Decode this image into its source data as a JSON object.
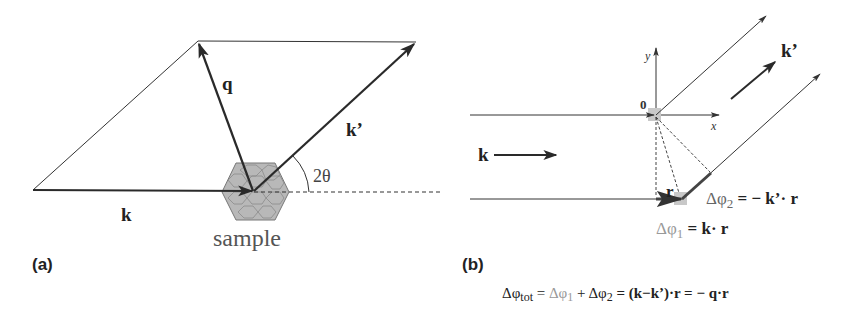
{
  "panel_a": {
    "label": "(a)",
    "vector_k": "k",
    "vector_k_prime": "k’",
    "vector_q": "q",
    "angle": "2θ",
    "sample_label": "sample"
  },
  "panel_b": {
    "label": "(b)",
    "axis_y": "y",
    "axis_x": "x",
    "origin": "0",
    "vector_k": "k",
    "vector_k_prime": "k’",
    "vector_r": "r",
    "eq_dphi2_lhs": "Δφ",
    "eq_dphi2_sub": "2",
    "eq_dphi2_rhs": " = − k’· r",
    "eq_dphi1_lhs": "Δφ",
    "eq_dphi1_sub": "1",
    "eq_dphi1_rhs": " = k· r",
    "eq_total": {
      "lhs": "Δφ",
      "lhs_sub": "tot",
      "eq1": " = ",
      "t1": "Δφ",
      "t1_sub": "1",
      "plus": " + Δφ",
      "t2_sub": "2",
      "rest": " = (k−k’)·r = − q·r"
    }
  },
  "colors": {
    "line": "#333333",
    "arrow": "#2a2a2a",
    "sample_fill": "#b8b8b8",
    "sample_stroke": "#777777",
    "grey_text": "#888888",
    "text": "#222222",
    "highlight": "#c8c8c8"
  }
}
